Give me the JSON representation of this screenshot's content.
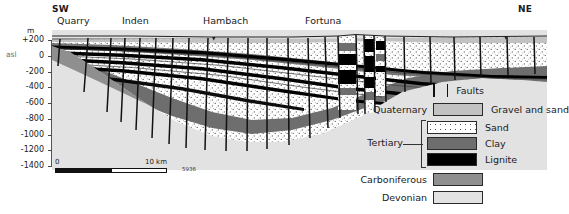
{
  "figure": {
    "type": "geological-cross-section",
    "orientation_left": "SW",
    "orientation_right": "NE"
  },
  "section_labels": {
    "places": [
      {
        "name": "Quarry",
        "x": 57
      },
      {
        "name": "Inden",
        "x": 122
      },
      {
        "name": "Hambach",
        "x": 203
      },
      {
        "name": "Fortuna",
        "x": 305
      }
    ],
    "rivers": [
      {
        "name": "river",
        "x": 163,
        "y": 31
      },
      {
        "name": "Rhine",
        "x": 495,
        "y": 31
      }
    ],
    "borehole_id": "5936"
  },
  "axis": {
    "unit": "m",
    "datum": "asl",
    "ticks": [
      "+200",
      "0",
      "-200",
      "-400",
      "-600",
      "-800",
      "-1000",
      "-1200",
      "-1400"
    ],
    "top_value": 200,
    "bottom_value": -1400,
    "step": 200
  },
  "scalebar": {
    "start": "0",
    "end": "10 km"
  },
  "legend": {
    "faults_label": "Faults",
    "groups": [
      {
        "period": "Quaternary",
        "units": [
          {
            "name": "Gravel and sand",
            "color": "#c2c2c2"
          }
        ]
      },
      {
        "period": "Tertiary",
        "units": [
          {
            "name": "Sand",
            "color": "#ffffff"
          },
          {
            "name": "Clay",
            "color": "#6e6e6e"
          },
          {
            "name": "Lignite",
            "color": "#000000"
          }
        ]
      },
      {
        "period": "Carboniferous",
        "units": [
          {
            "name": "Carboniferous",
            "color": "#8f8f8f"
          }
        ]
      },
      {
        "period": "Devonian",
        "units": [
          {
            "name": "Devonian",
            "color": "#e2e2e2"
          }
        ]
      }
    ]
  },
  "chart_data": {
    "type": "area",
    "xlabel": "",
    "ylabel": "m asl",
    "ylim": [
      -1400,
      200
    ],
    "grid": false,
    "legend_position": "right",
    "annotations": [
      "SW",
      "NE",
      "Quarry",
      "Inden",
      "Hambach",
      "Fortuna",
      "river",
      "Rhine",
      "5936"
    ],
    "units": [
      "Gravel and sand",
      "Sand",
      "Clay",
      "Lignite",
      "Carboniferous",
      "Devonian"
    ],
    "fault_count": 26,
    "section_length_km": 40
  }
}
